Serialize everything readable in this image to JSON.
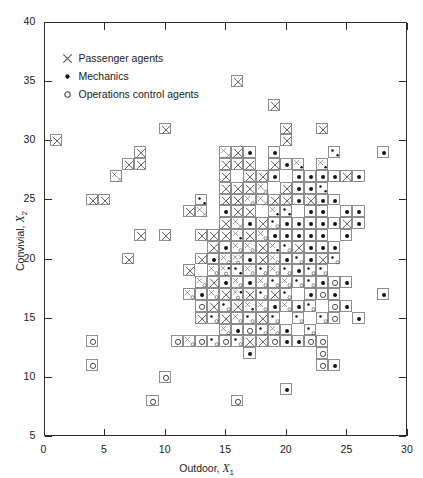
{
  "chart_data": {
    "type": "scatter",
    "title": "",
    "xlabel": "Outdoor, X1",
    "ylabel": "Convivial, X2",
    "xlim": [
      0,
      30
    ],
    "ylim": [
      5,
      40
    ],
    "xticks": [
      0,
      5,
      10,
      15,
      20,
      25,
      30
    ],
    "yticks": [
      5,
      10,
      15,
      20,
      25,
      30,
      35,
      40
    ],
    "grid": false,
    "legend_position": "top-left inside axes",
    "note": "Each plotted point occupies a unit grid cell drawn as a square box; a box may hold 1-3 symbols when observations coincide.",
    "series": [
      {
        "name": "Passenger agents",
        "marker": "x",
        "color": "#555555",
        "points": [
          [
            1,
            30
          ],
          [
            10,
            31
          ],
          [
            16,
            35
          ],
          [
            19,
            33
          ],
          [
            20,
            31
          ],
          [
            20,
            30
          ],
          [
            23,
            31
          ],
          [
            8,
            29
          ],
          [
            15,
            29
          ],
          [
            15,
            29
          ],
          [
            16,
            29
          ],
          [
            19,
            28
          ],
          [
            21,
            28
          ],
          [
            23,
            28
          ],
          [
            7,
            28
          ],
          [
            8,
            28
          ],
          [
            15,
            28
          ],
          [
            16,
            28
          ],
          [
            17,
            28
          ],
          [
            25,
            27
          ],
          [
            6,
            27
          ],
          [
            6,
            27
          ],
          [
            15,
            27
          ],
          [
            17,
            27
          ],
          [
            18,
            27
          ],
          [
            15,
            26
          ],
          [
            16,
            26
          ],
          [
            17,
            26
          ],
          [
            18,
            26
          ],
          [
            18,
            26
          ],
          [
            20,
            26
          ],
          [
            4,
            25
          ],
          [
            5,
            25
          ],
          [
            15,
            25
          ],
          [
            16,
            25
          ],
          [
            17,
            25
          ],
          [
            18,
            25
          ],
          [
            18,
            25
          ],
          [
            19,
            25
          ],
          [
            20,
            25
          ],
          [
            22,
            25
          ],
          [
            12,
            24
          ],
          [
            13,
            24
          ],
          [
            13,
            24
          ],
          [
            16,
            24
          ],
          [
            17,
            24
          ],
          [
            19,
            24
          ],
          [
            15,
            23
          ],
          [
            16,
            23
          ],
          [
            16,
            23
          ],
          [
            18,
            23
          ],
          [
            25,
            23
          ],
          [
            8,
            22
          ],
          [
            10,
            22
          ],
          [
            13,
            22
          ],
          [
            14,
            22
          ],
          [
            15,
            22
          ],
          [
            16,
            22
          ],
          [
            17,
            22
          ],
          [
            18,
            22
          ],
          [
            14,
            21
          ],
          [
            16,
            21
          ],
          [
            17,
            21
          ],
          [
            18,
            21
          ],
          [
            19,
            21
          ],
          [
            21,
            21
          ],
          [
            7,
            20
          ],
          [
            13,
            20
          ],
          [
            15,
            20
          ],
          [
            16,
            20
          ],
          [
            16,
            20
          ],
          [
            18,
            20
          ],
          [
            19,
            20
          ],
          [
            23,
            20
          ],
          [
            12,
            19
          ],
          [
            14,
            19
          ],
          [
            15,
            19
          ],
          [
            17,
            19
          ],
          [
            19,
            19
          ],
          [
            13,
            18
          ],
          [
            14,
            18
          ],
          [
            16,
            18
          ],
          [
            18,
            18
          ],
          [
            20,
            18
          ],
          [
            12,
            17
          ],
          [
            14,
            17
          ],
          [
            15,
            17
          ],
          [
            16,
            17
          ],
          [
            17,
            17
          ],
          [
            19,
            17
          ],
          [
            14,
            16
          ],
          [
            16,
            16
          ],
          [
            17,
            16
          ],
          [
            18,
            16
          ],
          [
            20,
            16
          ],
          [
            13,
            15
          ],
          [
            15,
            15
          ],
          [
            16,
            15
          ],
          [
            18,
            15
          ],
          [
            15,
            14
          ],
          [
            19,
            14
          ],
          [
            12,
            13
          ],
          [
            17,
            13
          ],
          [
            18,
            13
          ]
        ]
      },
      {
        "name": "Mechanics",
        "marker": "dot",
        "color": "#111111",
        "points": [
          [
            28,
            29
          ],
          [
            24,
            29
          ],
          [
            24,
            29
          ],
          [
            19,
            29
          ],
          [
            17,
            29
          ],
          [
            23,
            28
          ],
          [
            21,
            28
          ],
          [
            20,
            28
          ],
          [
            24,
            27
          ],
          [
            23,
            27
          ],
          [
            22,
            27
          ],
          [
            21,
            27
          ],
          [
            19,
            27
          ],
          [
            26,
            27
          ],
          [
            23,
            26
          ],
          [
            23,
            26
          ],
          [
            22,
            26
          ],
          [
            21,
            26
          ],
          [
            13,
            25
          ],
          [
            13,
            25
          ],
          [
            21,
            25
          ],
          [
            23,
            25
          ],
          [
            24,
            25
          ],
          [
            15,
            24
          ],
          [
            19,
            24
          ],
          [
            20,
            24
          ],
          [
            20,
            24
          ],
          [
            22,
            24
          ],
          [
            23,
            24
          ],
          [
            25,
            24
          ],
          [
            26,
            24
          ],
          [
            17,
            23
          ],
          [
            19,
            23
          ],
          [
            20,
            23
          ],
          [
            21,
            23
          ],
          [
            22,
            23
          ],
          [
            23,
            23
          ],
          [
            24,
            23
          ],
          [
            26,
            23
          ],
          [
            16,
            22
          ],
          [
            19,
            22
          ],
          [
            20,
            22
          ],
          [
            21,
            22
          ],
          [
            22,
            22
          ],
          [
            23,
            22
          ],
          [
            25,
            22
          ],
          [
            15,
            21
          ],
          [
            19,
            21
          ],
          [
            20,
            21
          ],
          [
            22,
            21
          ],
          [
            23,
            21
          ],
          [
            24,
            21
          ],
          [
            14,
            20
          ],
          [
            17,
            20
          ],
          [
            20,
            20
          ],
          [
            21,
            20
          ],
          [
            22,
            20
          ],
          [
            24,
            20
          ],
          [
            15,
            19
          ],
          [
            16,
            19
          ],
          [
            16,
            19
          ],
          [
            18,
            19
          ],
          [
            20,
            19
          ],
          [
            21,
            19
          ],
          [
            22,
            19
          ],
          [
            23,
            19
          ],
          [
            15,
            18
          ],
          [
            17,
            18
          ],
          [
            19,
            18
          ],
          [
            21,
            18
          ],
          [
            22,
            18
          ],
          [
            23,
            18
          ],
          [
            25,
            18
          ],
          [
            13,
            17
          ],
          [
            16,
            17
          ],
          [
            18,
            17
          ],
          [
            20,
            17
          ],
          [
            22,
            17
          ],
          [
            24,
            17
          ],
          [
            28,
            17
          ],
          [
            15,
            16
          ],
          [
            17,
            16
          ],
          [
            19,
            16
          ],
          [
            21,
            16
          ],
          [
            22,
            16
          ],
          [
            25,
            16
          ],
          [
            14,
            15
          ],
          [
            17,
            15
          ],
          [
            19,
            15
          ],
          [
            21,
            15
          ],
          [
            23,
            15
          ],
          [
            26,
            15
          ],
          [
            16,
            14
          ],
          [
            18,
            14
          ],
          [
            20,
            14
          ],
          [
            22,
            14
          ],
          [
            14,
            13
          ],
          [
            16,
            13
          ],
          [
            20,
            13
          ],
          [
            21,
            13
          ],
          [
            17,
            12
          ],
          [
            24,
            11
          ],
          [
            20,
            9
          ]
        ]
      },
      {
        "name": "Operations control agents",
        "marker": "circle",
        "color": "#444444",
        "points": [
          [
            17,
            25
          ],
          [
            19,
            23
          ],
          [
            18,
            22
          ],
          [
            16,
            21
          ],
          [
            17,
            21
          ],
          [
            20,
            21
          ],
          [
            15,
            20
          ],
          [
            16,
            20
          ],
          [
            19,
            20
          ],
          [
            21,
            20
          ],
          [
            24,
            20
          ],
          [
            14,
            19
          ],
          [
            15,
            19
          ],
          [
            17,
            19
          ],
          [
            18,
            19
          ],
          [
            19,
            19
          ],
          [
            20,
            19
          ],
          [
            22,
            19
          ],
          [
            23,
            19
          ],
          [
            13,
            18
          ],
          [
            16,
            18
          ],
          [
            18,
            18
          ],
          [
            19,
            18
          ],
          [
            20,
            18
          ],
          [
            21,
            18
          ],
          [
            22,
            18
          ],
          [
            24,
            18
          ],
          [
            12,
            17
          ],
          [
            14,
            17
          ],
          [
            16,
            17
          ],
          [
            18,
            17
          ],
          [
            20,
            17
          ],
          [
            23,
            17
          ],
          [
            13,
            16
          ],
          [
            15,
            16
          ],
          [
            18,
            16
          ],
          [
            20,
            16
          ],
          [
            22,
            16
          ],
          [
            24,
            16
          ],
          [
            14,
            15
          ],
          [
            16,
            15
          ],
          [
            17,
            15
          ],
          [
            19,
            15
          ],
          [
            21,
            15
          ],
          [
            23,
            15
          ],
          [
            24,
            15
          ],
          [
            15,
            14
          ],
          [
            17,
            14
          ],
          [
            18,
            14
          ],
          [
            19,
            14
          ],
          [
            22,
            14
          ],
          [
            13,
            13
          ],
          [
            14,
            13
          ],
          [
            15,
            13
          ],
          [
            16,
            13
          ],
          [
            19,
            13
          ],
          [
            22,
            13
          ],
          [
            23,
            13
          ],
          [
            4,
            13
          ],
          [
            11,
            13
          ],
          [
            12,
            13
          ],
          [
            23,
            12
          ],
          [
            23,
            11
          ],
          [
            4,
            11
          ],
          [
            10,
            10
          ],
          [
            9,
            8
          ],
          [
            16,
            8
          ]
        ]
      }
    ]
  },
  "legend": {
    "items": [
      {
        "symbol": "x-marker-icon",
        "label": "Passenger agents"
      },
      {
        "symbol": "dot-marker-icon",
        "label": "Mechanics"
      },
      {
        "symbol": "circle-marker-icon",
        "label": "Operations control agents"
      }
    ]
  },
  "axes": {
    "x": {
      "title_main": "Outdoor, ",
      "title_var": "X",
      "title_sub": "1",
      "ticks": [
        "0",
        "5",
        "10",
        "15",
        "20",
        "25",
        "30"
      ]
    },
    "y": {
      "title_main": "Convivial, ",
      "title_var": "X",
      "title_sub": "2",
      "ticks": [
        "5",
        "10",
        "15",
        "20",
        "25",
        "30",
        "35",
        "40"
      ]
    }
  },
  "style": {
    "frame_color": "#2b2b2b",
    "cell_border": "#8d8d8d",
    "x_color": "#555555",
    "dot_color": "#111111",
    "circle_color": "#444444",
    "background": "#ffffff"
  }
}
